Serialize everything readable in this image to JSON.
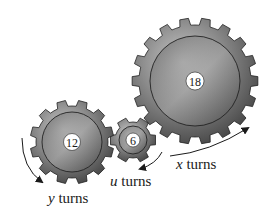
{
  "diagram": {
    "type": "gear-train",
    "gears": [
      {
        "id": "large",
        "teeth": 18,
        "label": "18",
        "cx": 195,
        "cy": 81,
        "r_outer": 63,
        "r_root": 56,
        "r_ring": 45,
        "hub_r": 9
      },
      {
        "id": "medium",
        "teeth": 12,
        "label": "12",
        "cx": 72,
        "cy": 142,
        "r_outer": 42,
        "r_root": 36,
        "r_ring": 30,
        "hub_r": 8.5
      },
      {
        "id": "small",
        "teeth": 6,
        "label": "6",
        "cx": 133,
        "cy": 140,
        "r_outer": 23,
        "r_root": 18,
        "r_ring": 14,
        "hub_r": 7
      }
    ],
    "labels": {
      "x": {
        "var": "x",
        "text": " turns"
      },
      "u": {
        "var": "u",
        "text": " turns"
      },
      "y": {
        "var": "y",
        "text": " turns"
      }
    },
    "colors": {
      "gear_light": "#b8b8b8",
      "gear_mid": "#7a7a7a",
      "gear_dark": "#3e3e3e",
      "outline": "#222222",
      "hub": "#ffffff",
      "text": "#1a1a1a"
    }
  }
}
